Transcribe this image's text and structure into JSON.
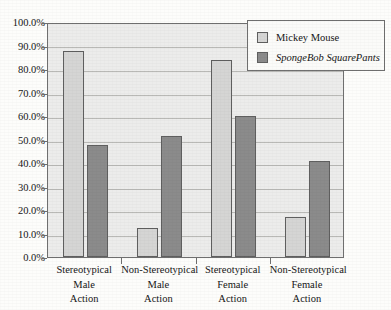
{
  "chart_data": {
    "type": "bar",
    "title": "",
    "xlabel": "",
    "ylabel": "",
    "ylim": [
      0,
      100
    ],
    "ytick_labels": [
      "100.0%",
      "90.0%",
      "80.0%",
      "70.0%",
      "60.0%",
      "50.0%",
      "40.0%",
      "30.0%",
      "20.0%",
      "10.0%",
      "0.0%"
    ],
    "ytick_values": [
      100,
      90,
      80,
      70,
      60,
      50,
      40,
      30,
      20,
      10,
      0
    ],
    "grid": true,
    "legend_position": "top-right",
    "categories": [
      "Stereotypical Male Action",
      "Non-Stereotypical Male Action",
      "Stereotypical Female Action",
      "Non-Stereotypical Female Action"
    ],
    "category_lines": [
      [
        "Stereotypical",
        "Male",
        "Action"
      ],
      [
        "Non-Stereotypical",
        "Male",
        "Action"
      ],
      [
        "Stereotypical",
        "Female",
        "Action"
      ],
      [
        "Non-Stereotypical",
        "Female",
        "Action"
      ]
    ],
    "series": [
      {
        "name": "Mickey Mouse",
        "italic": false,
        "color": "#d5d5d4",
        "values": [
          87.5,
          12.5,
          84.0,
          17.0
        ]
      },
      {
        "name": "SpongeBob SquarePants",
        "italic": true,
        "color": "#8b8b8b",
        "values": [
          47.5,
          51.5,
          60.0,
          41.0
        ]
      }
    ]
  },
  "colors": {
    "series_light": "#d5d5d4",
    "series_dark": "#8b8b8b",
    "plot_background": "#ececeb",
    "page_background": "#fdfdfb",
    "axis": "#6f6f6f",
    "gridline": "#b9b9b6",
    "text": "#161616"
  }
}
